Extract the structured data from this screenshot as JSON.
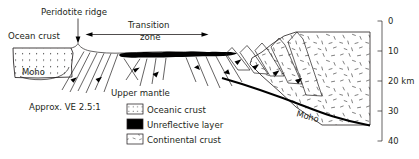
{
  "figure": {
    "type": "geological-cross-section",
    "background_color": "#ffffff",
    "line_color": "#231f20",
    "unreflective_color": "#000000"
  },
  "annotations": {
    "peridotite_ridge": "Peridotite ridge",
    "ocean_crust": "Ocean crust",
    "transition_zone_line1": "Transition",
    "transition_zone_line2": "zone",
    "upper_mantle": "Upper mantle",
    "moho_left": "Moho",
    "moho_right": "Moho",
    "vertical_exaggeration": "Approx. VE 2.5:1"
  },
  "legend": {
    "items": [
      {
        "label": "Oceanic crust",
        "swatch": "dotted-grid",
        "color": "#ffffff"
      },
      {
        "label": "Unreflective layer",
        "swatch": "solid-black",
        "color": "#000000"
      },
      {
        "label": "Continental crust",
        "swatch": "dash-speckle",
        "color": "#ffffff"
      }
    ]
  },
  "depth_scale": {
    "unit": "km",
    "unit_label": "20 km",
    "ticks": [
      "0",
      "10",
      "20 km",
      "30",
      "40"
    ],
    "values": [
      0,
      10,
      20,
      30,
      40
    ],
    "min": 0,
    "max": 40
  }
}
